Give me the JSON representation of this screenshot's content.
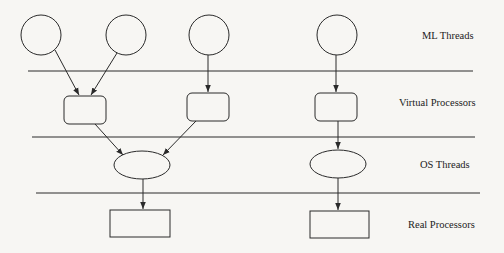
{
  "diagram": {
    "layers": [
      {
        "id": "ml-threads",
        "label": "ML Threads"
      },
      {
        "id": "virtual-processors",
        "label": "Virtual Processors"
      },
      {
        "id": "os-threads",
        "label": "OS Threads"
      },
      {
        "id": "real-processors",
        "label": "Real Processors"
      }
    ],
    "nodes": {
      "ml_threads": [
        {
          "id": "mlt1",
          "shape": "circle"
        },
        {
          "id": "mlt2",
          "shape": "circle"
        },
        {
          "id": "mlt3",
          "shape": "circle"
        },
        {
          "id": "mlt4",
          "shape": "circle"
        }
      ],
      "virtual_processors": [
        {
          "id": "vp1",
          "shape": "rounded-rect"
        },
        {
          "id": "vp2",
          "shape": "rounded-rect"
        },
        {
          "id": "vp3",
          "shape": "rounded-rect"
        }
      ],
      "os_threads": [
        {
          "id": "ost1",
          "shape": "ellipse"
        },
        {
          "id": "ost2",
          "shape": "ellipse"
        }
      ],
      "real_processors": [
        {
          "id": "rp1",
          "shape": "rect"
        },
        {
          "id": "rp2",
          "shape": "rect"
        }
      ]
    },
    "edges": [
      {
        "from": "mlt1",
        "to": "vp1"
      },
      {
        "from": "mlt2",
        "to": "vp1"
      },
      {
        "from": "mlt3",
        "to": "vp2"
      },
      {
        "from": "mlt4",
        "to": "vp3"
      },
      {
        "from": "vp1",
        "to": "ost1"
      },
      {
        "from": "vp2",
        "to": "ost1"
      },
      {
        "from": "vp3",
        "to": "ost2"
      },
      {
        "from": "ost1",
        "to": "rp1"
      },
      {
        "from": "ost2",
        "to": "rp2"
      }
    ],
    "colors": {
      "stroke": "#2a2a2a",
      "background": "#f7f6f3",
      "text": "#222222"
    }
  }
}
